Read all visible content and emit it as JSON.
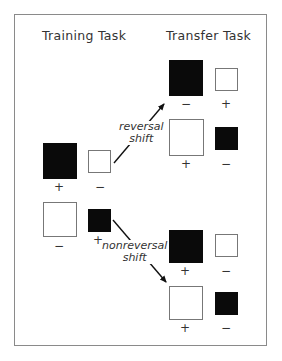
{
  "headings": {
    "training": "Training Task",
    "transfer": "Transfer Task"
  },
  "signs": {
    "plus": "+",
    "minus": "−"
  },
  "training": {
    "upper_pair": {
      "large": {
        "color": "black",
        "sign": "+"
      },
      "small": {
        "color": "white",
        "sign": "−"
      }
    },
    "lower_pair": {
      "large": {
        "color": "white",
        "sign": "−"
      },
      "small": {
        "color": "black",
        "sign": "+"
      }
    }
  },
  "transfer": {
    "reversal_1": {
      "large": {
        "color": "black",
        "sign": "−"
      },
      "small": {
        "color": "white",
        "sign": "+"
      }
    },
    "reversal_2": {
      "large": {
        "color": "white",
        "sign": "+"
      },
      "small": {
        "color": "black",
        "sign": "−"
      }
    },
    "nonreversal_1": {
      "large": {
        "color": "black",
        "sign": "+"
      },
      "small": {
        "color": "white",
        "sign": "−"
      }
    },
    "nonreversal_2": {
      "large": {
        "color": "white",
        "sign": "+"
      },
      "small": {
        "color": "black",
        "sign": "−"
      }
    }
  },
  "arrows": {
    "reversal": {
      "line1": "reversal",
      "line2": "shift"
    },
    "nonreversal": {
      "line1": "nonreversal",
      "line2": "shift"
    }
  },
  "colors": {
    "black": "#0a0a0a",
    "white": "#ffffff",
    "border": "#8a8a8a"
  }
}
